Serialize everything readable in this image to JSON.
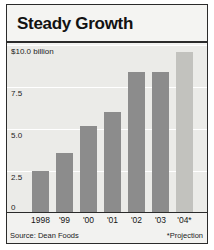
{
  "chart_data": {
    "type": "bar",
    "title": "Steady Growth",
    "xlabel": "",
    "ylabel": "",
    "unit_label": "$10.0 billion",
    "categories": [
      "1998",
      "'99",
      "'00",
      "'01",
      "'02",
      "'03",
      "'04*"
    ],
    "values": [
      2.5,
      3.6,
      5.2,
      6.0,
      8.4,
      8.4,
      9.6
    ],
    "series": [
      {
        "name": "Annual sales",
        "values": [
          2.5,
          3.6,
          5.2,
          6.0,
          8.4,
          8.4,
          9.6
        ],
        "projected_flags": [
          false,
          false,
          false,
          false,
          false,
          false,
          true
        ]
      }
    ],
    "ylim": [
      0,
      10
    ],
    "ytick_values": [
      0,
      2.5,
      5.0,
      7.5,
      10.0
    ],
    "ytick_labels": [
      "0",
      "2.5",
      "5.0",
      "7.5",
      "$10.0 billion"
    ],
    "grid": true,
    "legend": "none",
    "bar_color": "#8c8c8c",
    "projected_bar_color": "#c2c2be",
    "plot_background": "#ebebe8",
    "gridline_color": "#ffffff",
    "axis_color": "#2b2b2b",
    "text_color": "#151515",
    "annotations": [
      "*Projection"
    ],
    "source": "Source: Dean Foods"
  },
  "footer": {
    "source": "Source: Dean Foods",
    "projection_note": "*Projection"
  }
}
